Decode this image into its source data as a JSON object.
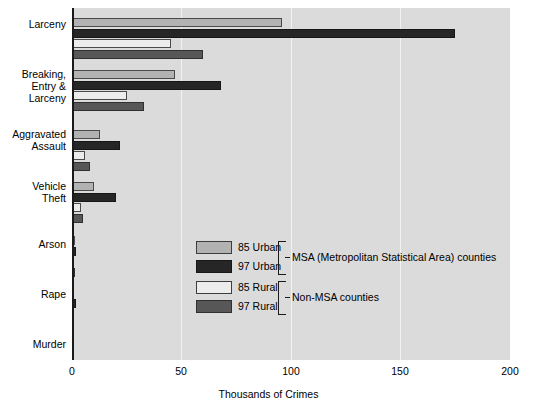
{
  "chart_data": {
    "type": "bar",
    "orientation": "horizontal",
    "title": "",
    "xlabel": "Thousands of Crimes",
    "ylabel": "",
    "xlim": [
      0,
      200
    ],
    "xticks": [
      0,
      50,
      100,
      150,
      200
    ],
    "xtick_labels": [
      "0",
      "50",
      "100",
      "150",
      "200"
    ],
    "grid": "vertical",
    "legend_position": "inside-center",
    "categories": [
      "Larceny",
      "Breaking, Entry & Larceny",
      "Aggravated Assault",
      "Vehicle Theft",
      "Arson",
      "Rape",
      "Murder"
    ],
    "series": [
      {
        "name": "85 Urban",
        "color": "#b2b2b2",
        "values": [
          96,
          47,
          13,
          10,
          1.2,
          1.0,
          0.6
        ]
      },
      {
        "name": "97 Urban",
        "color": "#262626",
        "values": [
          175,
          68,
          22,
          20,
          2.0,
          1.8,
          0.9
        ]
      },
      {
        "name": "85 Rural",
        "color": "#ececec",
        "values": [
          45,
          25,
          6,
          4,
          0.7,
          0.6,
          0.4
        ]
      },
      {
        "name": "97 Rural",
        "color": "#575757",
        "values": [
          60,
          33,
          8,
          5,
          1.3,
          1.1,
          0.5
        ]
      }
    ],
    "legend_groups": [
      {
        "label": "MSA (Metropolitan Statistical Area) counties",
        "series": [
          "85 Urban",
          "97 Urban"
        ]
      },
      {
        "label": "Non-MSA counties",
        "series": [
          "85 Rural",
          "97 Rural"
        ]
      }
    ]
  },
  "axis": {
    "x_title": "Thousands of Crimes",
    "tick_0": "0",
    "tick_1": "50",
    "tick_2": "100",
    "tick_3": "150",
    "tick_4": "200"
  },
  "category_labels": {
    "c0_line0": "Larceny",
    "c1_line0": "Breaking,",
    "c1_line1": "Entry &",
    "c1_line2": "Larceny",
    "c2_line0": "Aggravated",
    "c2_line1": "Assault",
    "c3_line0": "Vehicle",
    "c3_line1": "Theft",
    "c4_line0": "Arson",
    "c5_line0": "Rape",
    "c6_line0": "Murder"
  },
  "legend": {
    "items": [
      {
        "label": "85 Urban"
      },
      {
        "label": "97 Urban"
      },
      {
        "label": "85 Rural"
      },
      {
        "label": "97 Rural"
      }
    ],
    "group_msa": "MSA (Metropolitan Statistical Area) counties",
    "group_nonmsa": "Non-MSA counties"
  },
  "colors": {
    "plot_background": "#dbdbdb",
    "gridline": "#f2f2f2",
    "axis": "#1a1a1a",
    "series_85_urban": "#b2b2b2",
    "series_97_urban": "#262626",
    "series_85_rural": "#ececec",
    "series_97_rural": "#575757"
  }
}
